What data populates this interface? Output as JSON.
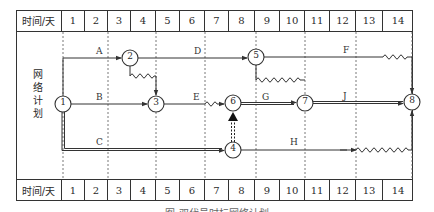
{
  "timeline": {
    "label": "时间/天",
    "days": [
      "1",
      "2",
      "3",
      "4",
      "5",
      "6",
      "7",
      "8",
      "9",
      "10",
      "11",
      "12",
      "13",
      "14"
    ]
  },
  "side_label": [
    "网",
    "络",
    "计",
    "划"
  ],
  "nodes": [
    {
      "id": "1",
      "label": "1"
    },
    {
      "id": "2",
      "label": "2"
    },
    {
      "id": "3",
      "label": "3"
    },
    {
      "id": "4",
      "label": "4"
    },
    {
      "id": "5",
      "label": "5"
    },
    {
      "id": "6",
      "label": "6"
    },
    {
      "id": "7",
      "label": "7"
    },
    {
      "id": "8",
      "label": "8"
    }
  ],
  "activities": [
    {
      "name": "A",
      "from": "1",
      "to": "2"
    },
    {
      "name": "B",
      "from": "1",
      "to": "3"
    },
    {
      "name": "C",
      "from": "1",
      "to": "4",
      "critical": true
    },
    {
      "name": "D",
      "from": "2",
      "to": "5"
    },
    {
      "name": "E",
      "from": "3",
      "to": "6"
    },
    {
      "name": "F",
      "from": "5",
      "to": "8"
    },
    {
      "name": "G",
      "from": "6",
      "to": "7",
      "critical": true
    },
    {
      "name": "H",
      "from": "4",
      "to": "8"
    },
    {
      "name": "J",
      "from": "7",
      "to": "8",
      "critical": true
    }
  ],
  "dummy_activities": [
    {
      "from": "2",
      "to": "3"
    },
    {
      "from": "4",
      "to": "6",
      "critical": true
    },
    {
      "from": "5",
      "to": "7"
    }
  ],
  "caption": "图 双代号时标网络计划"
}
